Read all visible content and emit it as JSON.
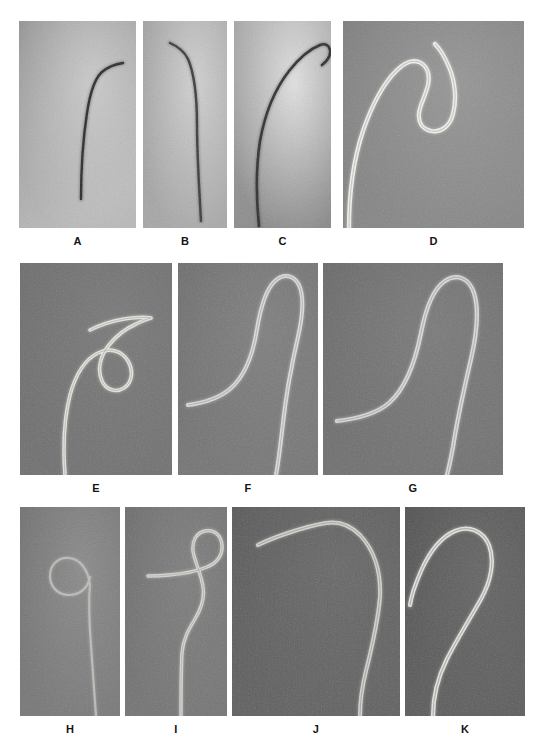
{
  "figure": {
    "kind": "radiographic-panel-figure",
    "width": 542,
    "height": 753,
    "background_color": "#ffffff",
    "label_color": "#141414",
    "rows": 3,
    "panel_count": 11
  },
  "panels": [
    {
      "label": "A",
      "row": 1,
      "x": 19,
      "y": 21,
      "w": 117,
      "h": 207,
      "label_x": 19,
      "label_w": 117,
      "label_y": 235,
      "bg_top": "#8e8e8e",
      "bg_bottom": "#b9b9b9",
      "bg_highlight": "#d2d2d2",
      "catheter_color": "#2a2a2a",
      "catheter_type": "dark-thin",
      "shape": "angled-tip",
      "stroke_width": 2.4,
      "path": "M 62 178 C 62 150, 64 118, 68 92 C 71 72, 75 58, 83 51 C 90 45, 97 43, 104 42"
    },
    {
      "label": "B",
      "row": 1,
      "x": 143,
      "y": 21,
      "w": 84,
      "h": 207,
      "label_x": 143,
      "label_w": 84,
      "label_y": 235,
      "bg_top": "#9c9c9c",
      "bg_bottom": "#a8a8a8",
      "bg_highlight": "#dadada",
      "catheter_color": "#3a3a3a",
      "catheter_type": "dark-thin",
      "shape": "gentle-curve",
      "stroke_width": 2.4,
      "path": "M 58 200 C 56 166, 54 132, 54 104 C 54 76, 51 52, 45 38 C 41 30, 34 25, 27 22"
    },
    {
      "label": "C",
      "row": 1,
      "x": 234,
      "y": 21,
      "w": 97,
      "h": 207,
      "label_x": 234,
      "label_w": 97,
      "label_y": 235,
      "bg_top": "#a0a0a0",
      "bg_bottom": "#8a8a8a",
      "bg_highlight": "#efefef",
      "catheter_color": "#2e2e2e",
      "catheter_type": "dark-thin",
      "shape": "long-reverse-curve",
      "stroke_width": 2.6,
      "path": "M 25 205 C 22 176, 22 146, 26 120 C 31 92, 41 68, 55 50 C 66 36, 76 28, 86 24 C 91 22, 95 24, 96 29 C 97 35, 93 40, 88 44"
    },
    {
      "label": "D",
      "row": 1,
      "x": 343,
      "y": 21,
      "w": 181,
      "h": 207,
      "label_x": 343,
      "label_w": 181,
      "label_y": 235,
      "bg_top": "#7b7b7b",
      "bg_bottom": "#868686",
      "bg_highlight": "#9a9a9a",
      "catheter_color": "#f2f2ee",
      "catheter_type": "bright-thick",
      "shape": "sigmoid-simmons",
      "stroke_width": 4.2,
      "path": "M 6 207 C 6 176, 10 140, 20 110 C 29 84, 41 62, 53 50 C 62 41, 71 38, 78 42 C 85 46, 87 55, 85 64 C 82 76, 77 84, 76 92 C 75 101, 79 108, 88 110 C 98 112, 107 105, 110 93 C 114 78, 112 60, 106 46 C 101 34, 96 27, 92 23"
    },
    {
      "label": "E",
      "row": 2,
      "x": 20,
      "y": 263,
      "w": 152,
      "h": 212,
      "label_x": 20,
      "label_w": 152,
      "label_y": 482,
      "bg_top": "#6a6a6a",
      "bg_bottom": "#707070",
      "bg_highlight": "#7a7a7a",
      "catheter_color": "#e6e6e0",
      "catheter_type": "bright-thick",
      "shape": "shepherd-hook",
      "stroke_width": 3.6,
      "path": "M 45 212 C 43 186, 44 156, 50 132 C 56 110, 66 96, 78 90 C 90 84, 102 88, 108 98 C 114 108, 112 120, 104 125 C 96 130, 86 127, 82 118 C 77 107, 80 93, 89 82 C 97 72, 107 65, 116 61 C 122 58, 127 56, 131 55 C 126 54, 116 54, 104 56 C 92 58, 80 62, 70 67"
    },
    {
      "label": "F",
      "row": 2,
      "x": 178,
      "y": 263,
      "w": 140,
      "h": 212,
      "label_x": 178,
      "label_w": 140,
      "label_y": 482,
      "bg_top": "#6b6b6b",
      "bg_bottom": "#757575",
      "bg_highlight": "#818181",
      "catheter_color": "#dedede",
      "catheter_type": "bright-thick",
      "shape": "long-hook",
      "stroke_width": 4.0,
      "path": "M 10 142 C 25 140, 40 136, 52 126 C 66 114, 75 92, 79 66 C 83 42, 88 26, 97 18 C 106 10, 116 12, 121 22 C 126 33, 125 52, 120 74 C 114 100, 108 132, 105 160 C 102 186, 100 202, 98 212"
    },
    {
      "label": "G",
      "row": 2,
      "x": 323,
      "y": 263,
      "w": 180,
      "h": 212,
      "label_x": 323,
      "label_w": 180,
      "label_y": 482,
      "bg_top": "#666666",
      "bg_bottom": "#707070",
      "bg_highlight": "#7c7c7c",
      "catheter_color": "#dcdcdc",
      "catheter_type": "bright-thick",
      "shape": "long-hook-wide",
      "stroke_width": 4.2,
      "path": "M 14 158 C 32 156, 52 152, 66 140 C 82 126, 92 100, 98 70 C 103 44, 110 26, 122 18 C 134 10, 146 15, 151 30 C 156 46, 154 70, 148 96 C 141 126, 134 158, 130 184 C 127 200, 125 208, 124 212"
    },
    {
      "label": "H",
      "row": 3,
      "x": 20,
      "y": 507,
      "w": 100,
      "h": 209,
      "label_x": 20,
      "label_w": 100,
      "label_y": 723,
      "bg_top": "#6d6d6d",
      "bg_bottom": "#787878",
      "bg_highlight": "#8e8e8e",
      "catheter_color": "#bcbcb8",
      "catheter_type": "bright-thin",
      "shape": "pigtail-loop",
      "stroke_width": 2.2,
      "path": "M 76 209 C 74 182, 72 152, 70 124 C 69 104, 69 88, 70 78 C 68 62, 60 52, 49 51 C 38 50, 30 58, 30 69 C 30 80, 38 88, 49 88 C 60 88, 68 81, 70 70"
    },
    {
      "label": "I",
      "row": 3,
      "x": 125,
      "y": 507,
      "w": 102,
      "h": 209,
      "label_x": 125,
      "label_w": 102,
      "label_y": 723,
      "bg_top": "#6a6a6a",
      "bg_bottom": "#747474",
      "bg_highlight": "#808080",
      "catheter_color": "#d8d8d4",
      "catheter_type": "bright-thick",
      "shape": "wavy-hook",
      "stroke_width": 3.4,
      "path": "M 56 209 C 56 186, 56 164, 57 146 C 58 132, 64 122, 70 112 C 76 102, 80 92, 78 80 C 76 66, 70 56, 68 44 C 67 34, 71 26, 80 24 C 89 22, 96 28, 97 38 C 98 48, 92 56, 82 60 C 70 65, 56 67, 44 68 C 35 69, 28 69, 23 69"
    },
    {
      "label": "J",
      "row": 3,
      "x": 232,
      "y": 507,
      "w": 168,
      "h": 209,
      "label_x": 232,
      "label_w": 168,
      "label_y": 723,
      "bg_top": "#565656",
      "bg_bottom": "#606060",
      "bg_highlight": "#6a6a6a",
      "catheter_color": "#d4d4d0",
      "catheter_type": "bright-thick",
      "shape": "obtuse-angle",
      "stroke_width": 4.0,
      "path": "M 128 209 C 128 196, 130 180, 134 164 C 140 140, 146 114, 148 90 C 149 66, 143 44, 128 28 C 118 18, 106 14, 94 16 C 82 18, 68 22, 56 26 C 44 30, 34 34, 26 38"
    },
    {
      "label": "K",
      "row": 3,
      "x": 405,
      "y": 507,
      "w": 120,
      "h": 209,
      "label_x": 405,
      "label_w": 120,
      "label_y": 723,
      "bg_top": "#4e4e4e",
      "bg_bottom": "#5c5c5c",
      "bg_highlight": "#666666",
      "catheter_color": "#e4e4e0",
      "catheter_type": "bright-thick",
      "shape": "reverse-curve-hook",
      "stroke_width": 4.2,
      "path": "M 28 209 C 28 192, 32 172, 42 152 C 52 132, 66 110, 76 92 C 86 74, 90 54, 84 38 C 78 24, 64 18, 50 24 C 36 30, 24 46, 16 64 C 10 78, 6 90, 5 98"
    }
  ],
  "labels": {
    "A": "A",
    "B": "B",
    "C": "C",
    "D": "D",
    "E": "E",
    "F": "F",
    "G": "G",
    "H": "H",
    "I": "I",
    "J": "J",
    "K": "K"
  }
}
